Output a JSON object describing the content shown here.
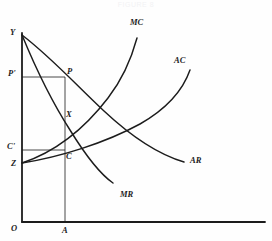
{
  "figure": {
    "title": "FIGURE 8",
    "background": "#fefefe",
    "ink": "#1c1c1c"
  },
  "axes": {
    "origin_label": "O",
    "y_top_label": "Y",
    "x_quantity_label": "A",
    "x_axis_y": 222,
    "y_axis_x": 22,
    "x_axis_end": 265,
    "y_axis_top": 33
  },
  "points": [
    {
      "name": "Y",
      "label": "Y",
      "x": 22,
      "y": 35,
      "label_x": 10,
      "label_y": 28
    },
    {
      "name": "P",
      "label": "P",
      "x": 65,
      "y": 77,
      "label_x": 67,
      "label_y": 67
    },
    {
      "name": "Pprime",
      "label": "P'",
      "x": 22,
      "y": 77,
      "label_x": 8,
      "label_y": 69
    },
    {
      "name": "X",
      "label": "X",
      "x": 65,
      "y": 118,
      "label_x": 66,
      "label_y": 110
    },
    {
      "name": "C",
      "label": "C",
      "x": 65,
      "y": 150,
      "label_x": 66,
      "label_y": 152
    },
    {
      "name": "Cprime",
      "label": "C'",
      "x": 22,
      "y": 150,
      "label_x": 7,
      "label_y": 142
    },
    {
      "name": "Z",
      "label": "Z",
      "x": 22,
      "y": 163,
      "label_x": 11,
      "label_y": 159
    },
    {
      "name": "A",
      "label": "A",
      "x": 65,
      "y": 222,
      "label_x": 62,
      "label_y": 226
    },
    {
      "name": "O",
      "label": "O",
      "x": 22,
      "y": 222,
      "label_x": 11,
      "label_y": 224
    }
  ],
  "curves": [
    {
      "name": "MC",
      "label": "MC",
      "label_x": 130,
      "label_y": 18,
      "path": "M 22 163 C 55 152, 85 128, 108 98 C 122 80, 131 60, 137 38"
    },
    {
      "name": "AC",
      "label": "AC",
      "label_x": 174,
      "label_y": 56,
      "path": "M 22 163 C 60 157, 105 143, 140 124 C 168 108, 183 90, 190 70"
    },
    {
      "name": "AR",
      "label": "AR",
      "label_x": 190,
      "label_y": 156,
      "path": "M 22 35 C 52 58, 75 84, 104 111 C 134 139, 160 155, 184 162"
    },
    {
      "name": "MR",
      "label": "MR",
      "label_x": 120,
      "label_y": 190,
      "path": "M 22 35 C 36 69, 52 102, 70 130 C 86 156, 100 174, 113 183"
    }
  ],
  "guide_lines": [
    {
      "name": "price-horizontal",
      "x1": 22,
      "y1": 77,
      "x2": 65,
      "y2": 77
    },
    {
      "name": "cost-horizontal",
      "x1": 22,
      "y1": 150,
      "x2": 65,
      "y2": 150
    },
    {
      "name": "quantity-vertical",
      "x1": 65,
      "y1": 77,
      "x2": 65,
      "y2": 222
    }
  ],
  "chart_data": {
    "type": "line",
    "title": "FIGURE 8",
    "xlabel": "",
    "ylabel": "",
    "legend_position": "inline-curve-ends",
    "grid": false,
    "annotations": [
      "Y",
      "P'",
      "P",
      "X",
      "C'",
      "C",
      "Z",
      "O",
      "A"
    ],
    "series": [
      {
        "name": "MC",
        "description": "Marginal Cost, rising from Z"
      },
      {
        "name": "AC",
        "description": "Average Cost, rising from Z"
      },
      {
        "name": "AR",
        "description": "Average Revenue, falling from Y"
      },
      {
        "name": "MR",
        "description": "Marginal Revenue, falling from Y"
      }
    ]
  }
}
